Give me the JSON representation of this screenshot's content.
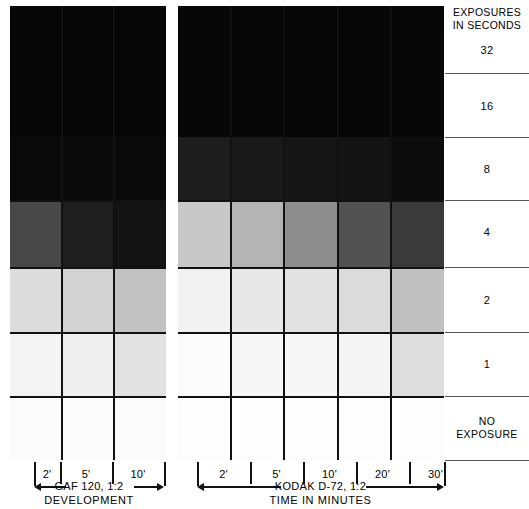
{
  "legend": {
    "title_line1": "EXPOSURES",
    "title_line2": "IN SECONDS",
    "rows": [
      {
        "label": "32"
      },
      {
        "label": "16"
      },
      {
        "label": "8"
      },
      {
        "label": "4"
      },
      {
        "label": "2"
      },
      {
        "label": "1"
      },
      {
        "label": "NO EXPOSURE",
        "line1": "NO",
        "line2": "EXPOSURE"
      }
    ]
  },
  "panels": [
    {
      "id": "gaf",
      "developer": "GAF 120, 1:2",
      "axis_caption": "DEVELOPMENT",
      "times": [
        "2'",
        "5'",
        "10'"
      ]
    },
    {
      "id": "kodak",
      "developer": "KODAK D-72, 1:2",
      "axis_caption": "TIME IN MINUTES",
      "times": [
        "2'",
        "5'",
        "10'",
        "20'",
        "30'"
      ]
    }
  ],
  "chart_data": {
    "type": "heatmap",
    "xlabel": "TIME IN MINUTES",
    "ylabel": "EXPOSURES IN SECONDS",
    "grid": true,
    "legend_position": "right",
    "value_meaning": "print density (0 = paper white, 100 = maximum black)",
    "rows": [
      "32",
      "16",
      "8",
      "4",
      "2",
      "1",
      "NO EXPOSURE"
    ],
    "panels": [
      {
        "name": "GAF 120, 1:2",
        "columns": [
          "2'",
          "5'",
          "10'"
        ],
        "colors": [
          [
            "#070707",
            "#070707",
            "#070707"
          ],
          [
            "#070707",
            "#070707",
            "#070707"
          ],
          [
            "#090909",
            "#090909",
            "#090909"
          ],
          [
            "#484848",
            "#1e1e1e",
            "#141414"
          ],
          [
            "#dcdcdc",
            "#d2d2d2",
            "#c2c2c2"
          ],
          [
            "#f4f4f4",
            "#efefef",
            "#e2e2e2"
          ],
          [
            "#fbfbfb",
            "#fbfbfb",
            "#fbfbfb"
          ]
        ],
        "density": [
          [
            97,
            97,
            97
          ],
          [
            97,
            97,
            97
          ],
          [
            96,
            96,
            96
          ],
          [
            72,
            88,
            92
          ],
          [
            14,
            18,
            24
          ],
          [
            4,
            6,
            11
          ],
          [
            2,
            2,
            2
          ]
        ]
      },
      {
        "name": "KODAK D-72, 1:2",
        "columns": [
          "2'",
          "5'",
          "10'",
          "20'",
          "30'"
        ],
        "colors": [
          [
            "#070707",
            "#070707",
            "#070707",
            "#070707",
            "#070707"
          ],
          [
            "#070707",
            "#070707",
            "#070707",
            "#070707",
            "#070707"
          ],
          [
            "#1d1d1d",
            "#191919",
            "#161616",
            "#141414",
            "#0c0c0c"
          ],
          [
            "#c8c8c8",
            "#b4b4b4",
            "#8e8e8e",
            "#525252",
            "#3a3a3a"
          ],
          [
            "#f2f2f2",
            "#e8e8e8",
            "#e2e2e2",
            "#dcdcdc",
            "#c0c0c0"
          ],
          [
            "#fbfbfb",
            "#f7f7f7",
            "#f7f7f7",
            "#f5f5f5",
            "#dedede"
          ],
          [
            "#fdfdfd",
            "#fdfdfd",
            "#fdfdfd",
            "#fdfdfd",
            "#fdfdfd"
          ]
        ],
        "density": [
          [
            97,
            97,
            97,
            97,
            97
          ],
          [
            97,
            97,
            97,
            97,
            97
          ],
          [
            89,
            90,
            91,
            92,
            95
          ],
          [
            22,
            29,
            44,
            68,
            77
          ],
          [
            5,
            9,
            11,
            14,
            25
          ],
          [
            2,
            3,
            3,
            4,
            13
          ],
          [
            1,
            1,
            1,
            1,
            1
          ]
        ]
      }
    ]
  }
}
